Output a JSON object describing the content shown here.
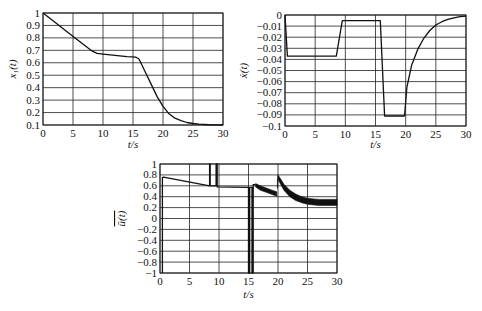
{
  "chart_data": [
    {
      "type": "line",
      "id": "x1",
      "title": "",
      "xlabel": "t/s",
      "ylabel": "x_1(t)",
      "xlim": [
        0,
        30
      ],
      "ylim": [
        0.1,
        1
      ],
      "grid": true,
      "xticks": [
        0,
        5,
        10,
        15,
        20,
        25,
        30
      ],
      "yticks": [
        0.1,
        0.2,
        0.3,
        0.4,
        0.5,
        0.6,
        0.7,
        0.8,
        0.9,
        1
      ],
      "ytick_labels": [
        "0.1",
        "0.2",
        "0.3",
        "0.4",
        "0.5",
        "0.6",
        "0.7",
        "0.8",
        "0.9",
        "1"
      ],
      "series": [
        {
          "name": "x1(t)",
          "x": [
            0,
            2,
            4,
            6,
            8,
            9,
            10,
            12,
            14,
            15.5,
            16,
            17,
            18,
            19,
            20,
            21,
            22,
            23,
            24,
            25,
            26,
            27,
            28,
            29,
            30
          ],
          "y": [
            1.0,
            0.925,
            0.85,
            0.775,
            0.7,
            0.675,
            0.67,
            0.66,
            0.65,
            0.645,
            0.63,
            0.53,
            0.43,
            0.33,
            0.25,
            0.19,
            0.155,
            0.135,
            0.12,
            0.112,
            0.107,
            0.104,
            0.102,
            0.101,
            0.1
          ]
        }
      ]
    },
    {
      "type": "line",
      "id": "xdot",
      "title": "",
      "xlabel": "t/s",
      "ylabel": "ẋ(t)",
      "xlim": [
        0,
        30
      ],
      "ylim": [
        -0.1,
        0
      ],
      "grid": true,
      "xticks": [
        0,
        5,
        10,
        15,
        20,
        25,
        30
      ],
      "yticks": [
        0,
        -0.01,
        -0.02,
        -0.03,
        -0.04,
        -0.05,
        -0.06,
        -0.07,
        -0.08,
        -0.09,
        -0.1
      ],
      "ytick_labels": [
        "0",
        "−0.01",
        "−0.02",
        "−0.03",
        "−0.04",
        "−0.05",
        "−0.06",
        "−0.07",
        "−0.08",
        "−0.09",
        "−0.1"
      ],
      "series": [
        {
          "name": "xdot(t)",
          "x": [
            0,
            0.4,
            8.5,
            9.5,
            15.8,
            16.5,
            19.8,
            20.2,
            21,
            22,
            23,
            24,
            25,
            26,
            27,
            28,
            29,
            30
          ],
          "y": [
            0,
            -0.037,
            -0.037,
            -0.005,
            -0.005,
            -0.091,
            -0.091,
            -0.065,
            -0.045,
            -0.031,
            -0.021,
            -0.014,
            -0.009,
            -0.006,
            -0.004,
            -0.0025,
            -0.0015,
            -0.001
          ]
        }
      ]
    },
    {
      "type": "line",
      "id": "ubar",
      "title": "",
      "xlabel": "t/s",
      "ylabel": "ū(t)",
      "xlim": [
        0,
        30
      ],
      "ylim": [
        -1,
        1
      ],
      "grid": true,
      "xticks": [
        0,
        5,
        10,
        15,
        20,
        25,
        30
      ],
      "yticks": [
        1,
        0.8,
        0.6,
        0.4,
        0.2,
        0,
        -0.2,
        -0.4,
        -0.6,
        -0.8,
        -1
      ],
      "ytick_labels": [
        "1",
        "0.8",
        "0.6",
        "0.4",
        "0.2",
        "0",
        "−0.2",
        "−0.4",
        "−0.6",
        "−0.8",
        "−1"
      ],
      "series": [
        {
          "name": "ubar(t)",
          "x": [
            0.4,
            0.4,
            0.6,
            8.4,
            8.4,
            8.5,
            8.5,
            9.5,
            9.5,
            9.7,
            9.7,
            15.0,
            15.0,
            15.2,
            15.2,
            15.6,
            15.6,
            15.8,
            15.8,
            16.2
          ],
          "y": [
            -1,
            0.75,
            0.76,
            0.6,
            1,
            1,
            0.6,
            0.6,
            1,
            1,
            0.58,
            0.57,
            -1,
            -1,
            0.57,
            0.57,
            -1,
            -1,
            0.62,
            0.62
          ]
        },
        {
          "name": "ubar_chatter_1",
          "band_x": [
            16.2,
            17,
            18,
            19,
            19.8
          ],
          "band_upper": [
            0.64,
            0.6,
            0.56,
            0.52,
            0.49
          ],
          "band_lower": [
            0.58,
            0.52,
            0.48,
            0.44,
            0.41
          ]
        },
        {
          "name": "ubar_chatter_2",
          "band_x": [
            19.9,
            20.0,
            20.5,
            21,
            22,
            23,
            24,
            25,
            26,
            27,
            28,
            29,
            30
          ],
          "band_upper": [
            0.7,
            0.8,
            0.72,
            0.63,
            0.52,
            0.45,
            0.4,
            0.37,
            0.36,
            0.35,
            0.35,
            0.35,
            0.35
          ],
          "band_lower": [
            0.55,
            0.72,
            0.62,
            0.52,
            0.4,
            0.33,
            0.29,
            0.26,
            0.25,
            0.24,
            0.24,
            0.24,
            0.24
          ]
        }
      ]
    }
  ],
  "layout": {
    "plots": [
      {
        "left": 43,
        "top": 13,
        "right": 223,
        "bottom": 125,
        "xlabel_y": 148,
        "ylabel_x": 16
      },
      {
        "left": 285,
        "top": 15,
        "right": 466,
        "bottom": 126,
        "xlabel_y": 148,
        "ylabel_x": 247
      },
      {
        "left": 160,
        "top": 164,
        "right": 337,
        "bottom": 273,
        "xlabel_y": 298,
        "ylabel_x": 125
      }
    ]
  },
  "labels": {
    "plot1_xlabel": "t/s",
    "plot2_xlabel": "t/s",
    "plot3_xlabel": "t/s"
  }
}
